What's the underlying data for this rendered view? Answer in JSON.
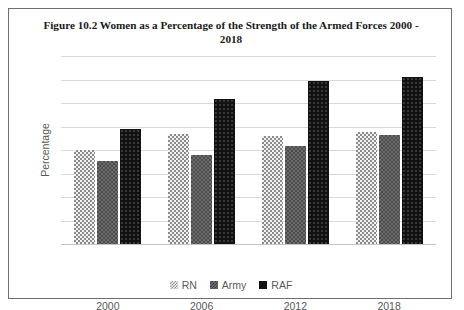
{
  "chart_data": {
    "type": "bar",
    "title": "Figure 10.2 Women as a Percentage of the Strength of the Armed Forces 2000 - 2018",
    "xlabel": "",
    "ylabel": "Percentage",
    "categories": [
      "2000",
      "2006",
      "2012",
      "2018"
    ],
    "series": [
      {
        "name": "RN",
        "values": [
          8.0,
          9.4,
          9.2,
          9.5
        ]
      },
      {
        "name": "Army",
        "values": [
          7.1,
          7.6,
          8.3,
          9.3
        ]
      },
      {
        "name": "RAF",
        "values": [
          9.8,
          12.3,
          13.9,
          14.2
        ]
      }
    ],
    "ylim": [
      0,
      16
    ],
    "yticks": [
      "0",
      "2",
      "4",
      "6",
      "8",
      "10",
      "12",
      "14",
      "16"
    ],
    "grid": true,
    "legend_position": "bottom"
  },
  "colors": {
    "rn": "#f2f2f2",
    "army": "#6e6e6e",
    "raf": "#111111",
    "grid": "#d9d9d9",
    "text": "#595959",
    "border": "#6f6f6f"
  }
}
